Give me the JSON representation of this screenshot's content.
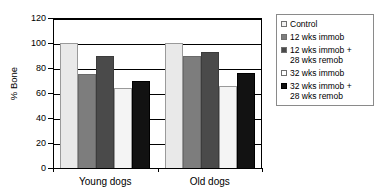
{
  "chart_data": {
    "type": "bar",
    "title": "",
    "xlabel": "",
    "ylabel": "% Bone",
    "ylim": [
      0,
      120
    ],
    "yticks": [
      0,
      20,
      40,
      60,
      80,
      100,
      120
    ],
    "ytick_labels": [
      "0",
      "20",
      "40",
      "60",
      "80",
      "100",
      "120"
    ],
    "grid": true,
    "legend_position": "right",
    "categories": [
      "Young dogs",
      "Old dogs"
    ],
    "series": [
      {
        "name": "Control",
        "values": [
          100,
          100
        ],
        "color": "#e9e9e9"
      },
      {
        "name": "12 wks immob",
        "values": [
          75,
          90
        ],
        "color": "#7d7d7d"
      },
      {
        "name": "12 wks immob +\n28 wks remob",
        "values": [
          90,
          93
        ],
        "color": "#4a4a4a"
      },
      {
        "name": "32 wks immob",
        "values": [
          64,
          66
        ],
        "color": "#f4f4f4"
      },
      {
        "name": "32 wks immob +\n28 wks remob",
        "values": [
          70,
          76
        ],
        "color": "#121212"
      }
    ]
  },
  "legend": {
    "items": [
      {
        "label": "Control"
      },
      {
        "label": "12 wks immob"
      },
      {
        "label": "12 wks immob +\n28 wks remob"
      },
      {
        "label": "32 wks immob"
      },
      {
        "label": "32 wks immob +\n28 wks remob"
      }
    ]
  },
  "axes": {
    "y_title": "% Bone",
    "y_tick_labels": [
      "120",
      "100",
      "80",
      "60",
      "40",
      "20",
      "0"
    ],
    "x_tick_labels": [
      "Young dogs",
      "Old dogs"
    ]
  }
}
